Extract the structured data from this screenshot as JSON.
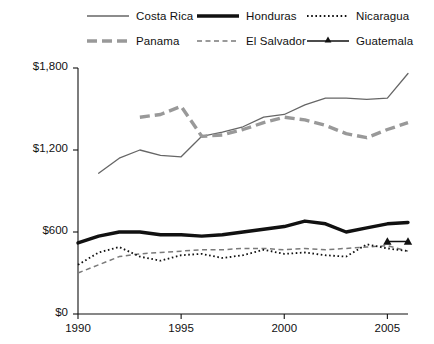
{
  "chart_data": {
    "type": "line",
    "title": "",
    "xlabel": "",
    "ylabel": "",
    "xlim": [
      1990,
      2006
    ],
    "ylim": [
      0,
      1800
    ],
    "grid": false,
    "legend_position": "top",
    "y_ticks": [
      0,
      600,
      1200,
      1800
    ],
    "y_tick_labels": [
      "$0",
      "$600",
      "$1,200",
      "$1,800"
    ],
    "x_ticks": [
      1990,
      1995,
      2000,
      2005
    ],
    "x_tick_labels": [
      "1990",
      "1995",
      "2000",
      "2005"
    ],
    "series": [
      {
        "name": "Costa Rica",
        "style": "solid-thin",
        "color": "#666666",
        "x": [
          1991,
          1992,
          1993,
          1994,
          1995,
          1996,
          1997,
          1998,
          1999,
          2000,
          2001,
          2002,
          2003,
          2004,
          2005,
          2006
        ],
        "values": [
          1030,
          1140,
          1200,
          1160,
          1150,
          1300,
          1330,
          1370,
          1440,
          1460,
          1530,
          1580,
          1580,
          1570,
          1580,
          1760
        ]
      },
      {
        "name": "Panama",
        "style": "dashed-thick",
        "color": "#999999",
        "x": [
          1993,
          1994,
          1995,
          1996,
          1997,
          1998,
          1999,
          2000,
          2001,
          2002,
          2003,
          2004,
          2005,
          2006
        ],
        "values": [
          1440,
          1460,
          1520,
          1300,
          1310,
          1350,
          1400,
          1440,
          1420,
          1380,
          1320,
          1290,
          1350,
          1400
        ]
      },
      {
        "name": "Honduras",
        "style": "solid-thick",
        "color": "#111111",
        "x": [
          1990,
          1991,
          1992,
          1993,
          1994,
          1995,
          1996,
          1997,
          1998,
          1999,
          2000,
          2001,
          2002,
          2003,
          2004,
          2005,
          2006
        ],
        "values": [
          520,
          570,
          600,
          600,
          580,
          580,
          570,
          580,
          600,
          620,
          640,
          680,
          660,
          600,
          630,
          660,
          670
        ]
      },
      {
        "name": "El Salvador",
        "style": "dashed-thin",
        "color": "#7a7a7a",
        "x": [
          1990,
          1991,
          1992,
          1993,
          1994,
          1995,
          1996,
          1997,
          1998,
          1999,
          2000,
          2001,
          2002,
          2003,
          2004,
          2005,
          2006
        ],
        "values": [
          300,
          360,
          420,
          440,
          450,
          460,
          470,
          470,
          480,
          480,
          470,
          480,
          470,
          480,
          490,
          500,
          460
        ]
      },
      {
        "name": "Nicaragua",
        "style": "dotted",
        "color": "#111111",
        "x": [
          1990,
          1991,
          1992,
          1993,
          1994,
          1995,
          1996,
          1997,
          1998,
          1999,
          2000,
          2001,
          2002,
          2003,
          2004,
          2005,
          2006
        ],
        "values": [
          360,
          450,
          490,
          420,
          390,
          430,
          440,
          410,
          430,
          470,
          440,
          450,
          430,
          420,
          510,
          480,
          460
        ]
      },
      {
        "name": "Guatemala",
        "style": "solid-marker",
        "color": "#111111",
        "x": [
          2005,
          2006
        ],
        "values": [
          530,
          530
        ]
      }
    ],
    "legend_entries": [
      {
        "label": "Costa Rica",
        "style": "solid-thin"
      },
      {
        "label": "Honduras",
        "style": "solid-thick"
      },
      {
        "label": "Nicaragua",
        "style": "dotted"
      },
      {
        "label": "Panama",
        "style": "dashed-thick"
      },
      {
        "label": "El Salvador",
        "style": "dashed-thin"
      },
      {
        "label": "Guatemala",
        "style": "solid-marker"
      }
    ]
  }
}
